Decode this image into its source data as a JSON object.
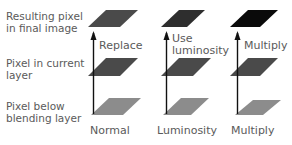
{
  "rows": {
    "result": "Resulting pixel\nin final image",
    "result_line1": "Resulting pixel",
    "result_line2": "in final image",
    "current_line1": "Pixel in current",
    "current_line2": "layer",
    "below_line1": "Pixel below",
    "below_line2": "blending layer"
  },
  "columns": [
    {
      "mode": "Normal",
      "operation_line1": "Replace",
      "operation_line2": "",
      "colors": {
        "result": "#4a4a4a",
        "current": "#4a4a4a",
        "below": "#8c8c8c"
      }
    },
    {
      "mode": "Luminosity",
      "operation_line1": "Use",
      "operation_line2": "luminosity",
      "colors": {
        "result": "#2e2e2e",
        "current": "#4a4a4a",
        "below": "#8c8c8c"
      }
    },
    {
      "mode": "Multiply",
      "operation_line1": "Multiply",
      "operation_line2": "",
      "colors": {
        "result": "#0a0a0a",
        "current": "#4a4a4a",
        "below": "#8c8c8c"
      }
    }
  ]
}
